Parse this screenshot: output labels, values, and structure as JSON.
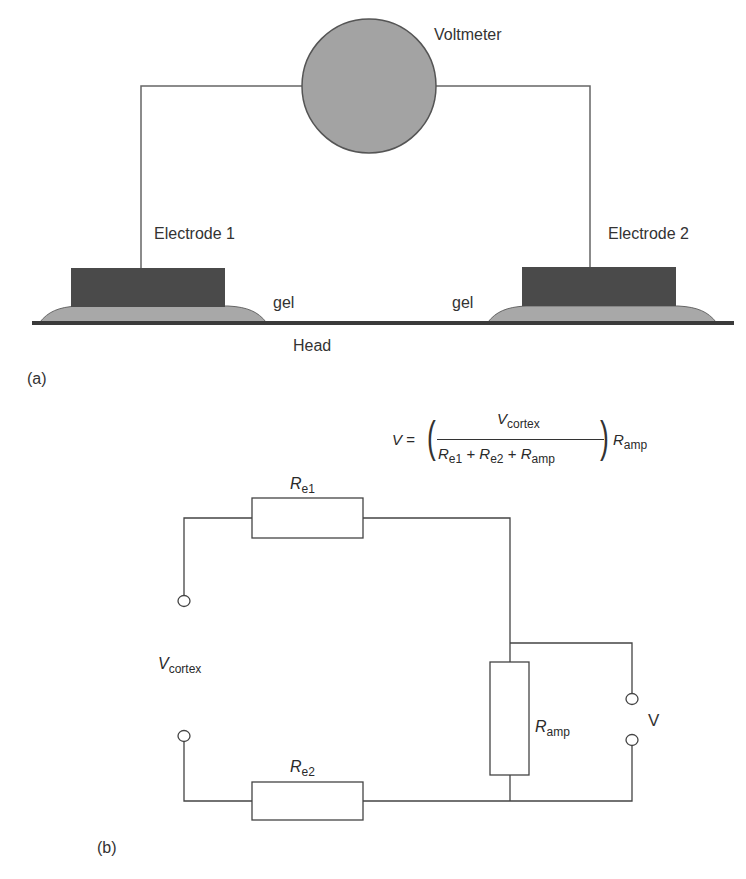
{
  "panel_a": {
    "caption": "(a)",
    "voltmeter_label": "Voltmeter",
    "electrode1_label": "Electrode 1",
    "electrode2_label": "Electrode 2",
    "gel_left_label": "gel",
    "gel_right_label": "gel",
    "head_label": "Head"
  },
  "panel_b": {
    "caption": "(b)",
    "formula": {
      "lhs": "V",
      "equals": "=",
      "numerator_main": "V",
      "numerator_sub": "cortex",
      "den_r1": "R",
      "den_r1_sub": "e1",
      "plus1": "+",
      "den_r2": "R",
      "den_r2_sub": "e2",
      "plus2": "+",
      "den_r3": "R",
      "den_r3_sub": "amp",
      "rhs_main": "R",
      "rhs_sub": "amp"
    },
    "re1_main": "R",
    "re1_sub": "e1",
    "re2_main": "R",
    "re2_sub": "e2",
    "ramp_main": "R",
    "ramp_sub": "amp",
    "vcortex_main": "V",
    "vcortex_sub": "cortex",
    "v_label": "V"
  },
  "colors": {
    "voltmeter_fill": "#a3a3a3",
    "electrode_fill": "#4a4a4a",
    "gel_fill": "#a8a8a8",
    "head_line": "#3a3a3a",
    "wire": "#555555"
  }
}
